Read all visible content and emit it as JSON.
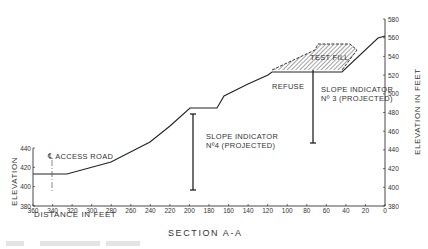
{
  "title": "SECTION A-A",
  "chart_data": {
    "type": "line",
    "title": "SECTION A-A",
    "xlabel": "DISTANCE IN FEET",
    "ylabel_left": "ELEVATION",
    "ylabel_right": "ELEVATION IN FEET",
    "x_axis": {
      "min": 0,
      "max": 360,
      "reversed": true,
      "ticks": [
        360,
        340,
        320,
        300,
        280,
        260,
        240,
        220,
        200,
        180,
        160,
        140,
        120,
        100,
        80,
        60,
        40,
        20,
        0
      ]
    },
    "y_axis_left": {
      "min": 380,
      "max": 440,
      "ticks": [
        380,
        400,
        420,
        440
      ]
    },
    "y_axis_right": {
      "min": 380,
      "max": 580,
      "ticks": [
        380,
        400,
        420,
        440,
        460,
        480,
        500,
        520,
        540,
        560,
        580
      ]
    },
    "series": [
      {
        "name": "Ground profile",
        "points": [
          {
            "distance": 360,
            "elevation": 414
          },
          {
            "distance": 325,
            "elevation": 414
          },
          {
            "distance": 280,
            "elevation": 427
          },
          {
            "distance": 240,
            "elevation": 448
          },
          {
            "distance": 220,
            "elevation": 466
          },
          {
            "distance": 200,
            "elevation": 484
          },
          {
            "distance": 172,
            "elevation": 484
          },
          {
            "distance": 165,
            "elevation": 497
          },
          {
            "distance": 140,
            "elevation": 510
          },
          {
            "distance": 120,
            "elevation": 520
          },
          {
            "distance": 115,
            "elevation": 523
          },
          {
            "distance": 44,
            "elevation": 523
          },
          {
            "distance": 7,
            "elevation": 560
          },
          {
            "distance": 0,
            "elevation": 562
          }
        ]
      },
      {
        "name": "Test fill",
        "points": [
          {
            "distance": 115,
            "elevation": 523
          },
          {
            "distance": 72,
            "elevation": 545
          },
          {
            "distance": 69,
            "elevation": 552
          },
          {
            "distance": 35,
            "elevation": 552
          },
          {
            "distance": 28,
            "elevation": 545
          },
          {
            "distance": 44,
            "elevation": 523
          }
        ]
      }
    ],
    "annotations": [
      {
        "text": "℄ ACCESS ROAD",
        "distance": 340
      },
      {
        "text": "SLOPE INDICATOR",
        "text2": "Nº4 (PROJECTED)",
        "distance": 197,
        "top_elevation": 474,
        "bottom_elevation": 394
      },
      {
        "text": "SLOPE INDICATOR",
        "text2": "Nº 3 (PROJECTED)",
        "distance": 77,
        "top_elevation": 523,
        "bottom_elevation": 445
      },
      {
        "text": "TEST FILL"
      },
      {
        "text": "REFUSE"
      }
    ]
  },
  "labels": {
    "access_road": "℄ ACCESS ROAD",
    "si4_line1": "SLOPE INDICATOR",
    "si4_line2": "Nº4 (PROJECTED)",
    "si3_line1": "SLOPE INDICATOR",
    "si3_line2": "Nº 3 (PROJECTED)",
    "test_fill": "TEST FILL",
    "refuse": "REFUSE",
    "xlabel": "DISTANCE IN FEET",
    "ylabel_left": "ELEVATION",
    "ylabel_right": "ELEVATION IN FEET",
    "caption": "SECTION A-A"
  },
  "ticks": {
    "x": [
      "360",
      "340",
      "320",
      "300",
      "280",
      "260",
      "240",
      "220",
      "200",
      "180",
      "160",
      "140",
      "120",
      "100",
      "80",
      "60",
      "40",
      "20",
      "0"
    ],
    "yl": [
      "380",
      "400",
      "420",
      "440"
    ],
    "yr": [
      "380",
      "400",
      "420",
      "440",
      "460",
      "480",
      "500",
      "520",
      "540",
      "560",
      "580"
    ]
  }
}
